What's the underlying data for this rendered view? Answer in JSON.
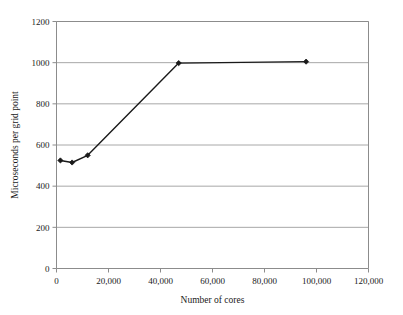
{
  "chart_data": {
    "type": "line",
    "title": "",
    "xlabel": "Number of cores",
    "ylabel": "Microseconds per grid point",
    "xlim": [
      0,
      120000
    ],
    "ylim": [
      0,
      1200
    ],
    "grid": "horizontal",
    "legend": "none",
    "x_tick_labels": [
      "0",
      "20,000",
      "40,000",
      "60,000",
      "80,000",
      "100,000",
      "120,000"
    ],
    "x_ticks": [
      0,
      20000,
      40000,
      60000,
      80000,
      100000,
      120000
    ],
    "y_tick_labels": [
      "0",
      "200",
      "400",
      "600",
      "800",
      "1000",
      "1200"
    ],
    "y_ticks": [
      0,
      200,
      400,
      600,
      800,
      1000,
      1200
    ],
    "series": [
      {
        "name": "Microseconds per grid point",
        "marker": "filled-diamond",
        "color": "#1a1a1a",
        "x": [
          1500,
          6000,
          12000,
          47000,
          96000
        ],
        "y": [
          525,
          515,
          550,
          998,
          1005
        ]
      }
    ]
  },
  "style": {
    "line_color": "#1a1a1a",
    "marker_color": "#1a1a1a",
    "grid_color": "#a8a8a8",
    "axis_color": "#8c8c8c",
    "background": "#ffffff"
  }
}
